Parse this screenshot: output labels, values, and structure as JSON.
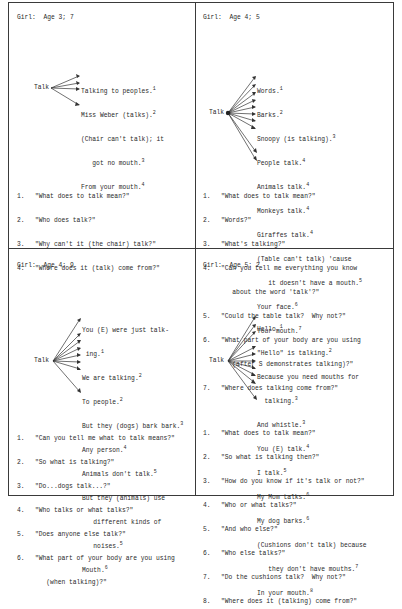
{
  "panels": [
    {
      "title": "Girl:  Age 3; 7",
      "center_word": "Talk",
      "responses": [
        {
          "text": "Talking to peoples.",
          "note": "1"
        },
        {
          "text": "Miss Weber (talks).",
          "note": "2"
        },
        {
          "text": "(Chair can't talk); it",
          "note": ""
        },
        {
          "text": "   got no mouth.",
          "note": "3"
        },
        {
          "text": "From your mouth.",
          "note": "4"
        }
      ],
      "questions": [
        {
          "num": "1.",
          "text": "\"What does to talk mean?\""
        },
        {
          "num": "2.",
          "text": "\"Who does talk?\""
        },
        {
          "num": "3.",
          "text": "\"Why can't it (the chair) talk?\""
        },
        {
          "num": "4.",
          "text": "\"Where does it (talk) come from?\""
        }
      ]
    },
    {
      "title": "Girl:  Age 4; 5",
      "center_word": "Talk",
      "responses": [
        {
          "text": "Words.",
          "note": "1"
        },
        {
          "text": "Barks.",
          "note": "2"
        },
        {
          "text": "Snoopy (is talking).",
          "note": "3"
        },
        {
          "text": "People talk.",
          "note": "4"
        },
        {
          "text": "Animals talk.",
          "note": "4"
        },
        {
          "text": "Monkeys talk.",
          "note": "4"
        },
        {
          "text": "Giraffes talk.",
          "note": "4"
        },
        {
          "text": "(Table can't talk) 'cause",
          "note": ""
        },
        {
          "text": "   it doesn't have a mouth.",
          "note": "5"
        },
        {
          "text": "Your face.",
          "note": "6"
        },
        {
          "text": "Your mouth.",
          "note": "7"
        }
      ],
      "questions": [
        {
          "num": "1.",
          "text": "\"What does to talk mean?\""
        },
        {
          "num": "2.",
          "text": "\"Words?\""
        },
        {
          "num": "3.",
          "text": "\"What's talking?\""
        },
        {
          "num": "4.",
          "text": "\"Can you tell me everything you know"
        },
        {
          "num": "",
          "text": "   about the word 'talk'?\""
        },
        {
          "num": "5.",
          "text": "\"Could the table talk?  Why not?\""
        },
        {
          "num": "6.",
          "text": "\"What part of your body are you using"
        },
        {
          "num": "",
          "text": "   (after S demonstrates talking)?\""
        },
        {
          "num": "7.",
          "text": "\"Where does talking come from?\""
        }
      ]
    },
    {
      "title": "Girl:  Age 4; 9",
      "center_word": "Talk",
      "responses": [
        {
          "text": "You (E) were just talk-",
          "note": ""
        },
        {
          "text": " ing.",
          "note": "1"
        },
        {
          "text": "We are talking.",
          "note": "2"
        },
        {
          "text": "To people.",
          "note": "2"
        },
        {
          "text": "But they (dogs) bark bark.",
          "note": "3"
        },
        {
          "text": "Any person.",
          "note": "4"
        },
        {
          "text": "Animals don't talk.",
          "note": "5"
        },
        {
          "text": "But they (animals) use",
          "note": ""
        },
        {
          "text": "   different kinds of",
          "note": ""
        },
        {
          "text": "   noises.",
          "note": "5"
        },
        {
          "text": "Mouth.",
          "note": "6"
        }
      ],
      "questions": [
        {
          "num": "1.",
          "text": "\"Can you tell me what to talk means?\""
        },
        {
          "num": "2.",
          "text": "\"So what is talking?\""
        },
        {
          "num": "3.",
          "text": "\"Do...dogs talk...?\""
        },
        {
          "num": "4.",
          "text": "\"Who talks or what talks?\""
        },
        {
          "num": "5.",
          "text": "\"Does anyone else talk?\""
        },
        {
          "num": "6.",
          "text": "\"What part of your body are you using"
        },
        {
          "num": "",
          "text": "   (when talking)?\""
        }
      ]
    },
    {
      "title": "Girl:  Age 5; 2",
      "center_word": "Talk",
      "responses": [
        {
          "text": "Hello.",
          "note": "1"
        },
        {
          "text": "\"Hello\" is talking.",
          "note": "2"
        },
        {
          "text": "Because you need mouths for",
          "note": ""
        },
        {
          "text": "  talking.",
          "note": "3"
        },
        {
          "text": "And whistle.",
          "note": "3"
        },
        {
          "text": "You (E) talk.",
          "note": "4"
        },
        {
          "text": "I talk.",
          "note": "5"
        },
        {
          "text": "My Mom talks.",
          "note": "6"
        },
        {
          "text": "My dog barks.",
          "note": "6"
        },
        {
          "text": "(Cushions don't talk) because",
          "note": ""
        },
        {
          "text": "   they don't have mouths.",
          "note": "7"
        },
        {
          "text": "In your mouth.",
          "note": "8"
        }
      ],
      "questions": [
        {
          "num": "1.",
          "text": "\"What does to talk mean?\""
        },
        {
          "num": "2.",
          "text": "\"So what is talking then?\""
        },
        {
          "num": "3.",
          "text": "\"How do you know if it's talk or not?\""
        },
        {
          "num": "4.",
          "text": "\"Who or what talks?\""
        },
        {
          "num": "5.",
          "text": "\"And who else?\""
        },
        {
          "num": "6.",
          "text": "\"Who else talks?\""
        },
        {
          "num": "7.",
          "text": "\"Do the cushions talk?  Why not?\""
        },
        {
          "num": "8.",
          "text": "\"Where does it (talking) come from?\""
        }
      ]
    }
  ]
}
